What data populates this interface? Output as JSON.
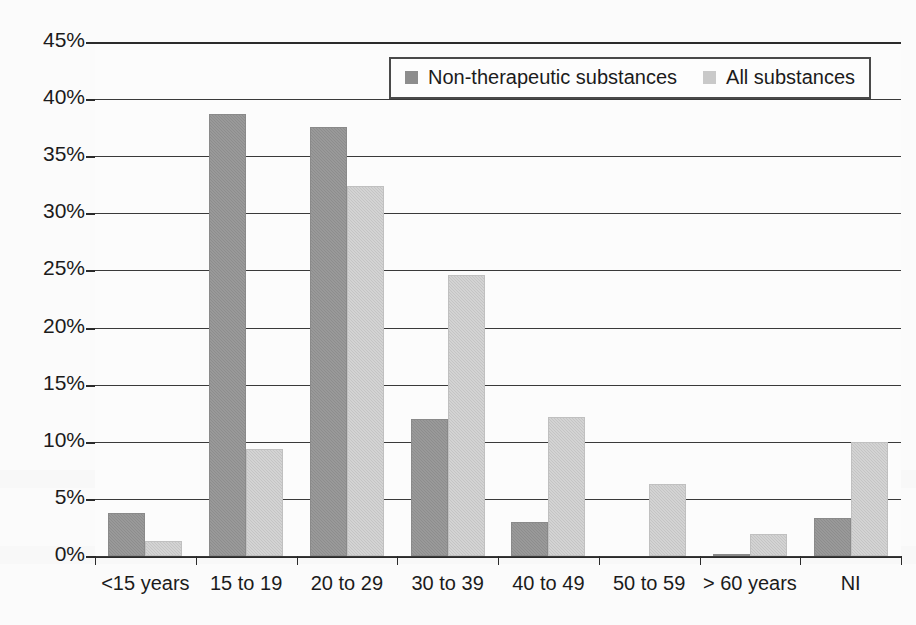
{
  "chart_data": {
    "type": "bar",
    "title": "",
    "xlabel": "",
    "ylabel": "",
    "grid": true,
    "legend_position": "top-right",
    "ylim": [
      0,
      45
    ],
    "ytick_labels": [
      "45%",
      "40%",
      "35%",
      "30%",
      "25%",
      "20%",
      "15%",
      "10%",
      "5%",
      "0%"
    ],
    "ytick_values": [
      45,
      40,
      35,
      30,
      25,
      20,
      15,
      10,
      5,
      0
    ],
    "categories": [
      "<15 years",
      "15 to 19",
      "20 to 29",
      "30 to 39",
      "40 to 49",
      "50 to 59",
      "> 60 years",
      "NI"
    ],
    "series": [
      {
        "name": "Non-therapeutic substances",
        "color": "#8d8d8d",
        "values": [
          3.8,
          38.7,
          37.6,
          12.0,
          3.0,
          0.0,
          0.2,
          3.3
        ]
      },
      {
        "name": "All substances",
        "color": "#c4c4c4",
        "values": [
          1.3,
          9.4,
          32.4,
          24.6,
          12.2,
          6.3,
          1.9,
          10.0
        ]
      }
    ]
  },
  "legend": {
    "items": [
      {
        "label": "Non-therapeutic substances",
        "swatch": "dark"
      },
      {
        "label": "All substances",
        "swatch": "light"
      }
    ]
  }
}
